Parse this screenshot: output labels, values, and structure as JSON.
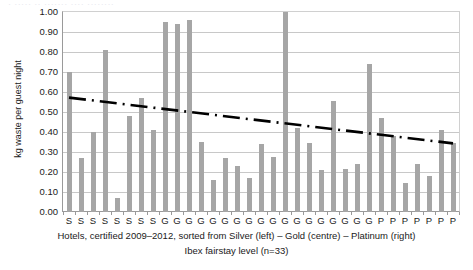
{
  "title_remnant": "· ····· ·· ······· ···· ········",
  "chart_data": {
    "type": "bar",
    "title": "",
    "xlabel": "Hotels, certified 2009–2012, sorted from Silver (left) – Gold (centre) – Platinum (right)",
    "xlabel_line2": "Ibex fairstay level (n=33)",
    "ylabel": "kg waste per guest night",
    "ylim": [
      0.0,
      1.0
    ],
    "ytick_labels": [
      "1.00",
      "0.90",
      "0.80",
      "0.70",
      "0.60",
      "0.50",
      "0.40",
      "0.30",
      "0.20",
      "0.10",
      "0.00"
    ],
    "ytick_values": [
      1.0,
      0.9,
      0.8,
      0.7,
      0.6,
      0.5,
      0.4,
      0.3,
      0.2,
      0.1,
      0.0
    ],
    "grid": true,
    "legend": "none",
    "bar_color": "#a6a6a6",
    "trend_color": "#000000",
    "n": 33,
    "categories": [
      "S",
      "S",
      "S",
      "S",
      "S",
      "S",
      "S",
      "S",
      "G",
      "G",
      "G",
      "G",
      "G",
      "G",
      "G",
      "G",
      "G",
      "G",
      "G",
      "G",
      "G",
      "G",
      "G",
      "G",
      "G",
      "G",
      "P",
      "P",
      "P",
      "P",
      "P",
      "P",
      "P"
    ],
    "values": [
      0.7,
      0.27,
      0.4,
      0.81,
      0.07,
      0.48,
      0.57,
      0.41,
      0.95,
      0.94,
      0.96,
      0.35,
      0.16,
      0.27,
      0.23,
      0.17,
      0.34,
      0.275,
      1.0,
      0.42,
      0.345,
      0.21,
      0.555,
      0.215,
      0.24,
      0.74,
      0.47,
      0.38,
      0.145,
      0.24,
      0.18,
      0.41,
      0.345
    ],
    "series": [
      {
        "name": "kg waste per guest night",
        "values": [
          0.7,
          0.27,
          0.4,
          0.81,
          0.07,
          0.48,
          0.57,
          0.41,
          0.95,
          0.94,
          0.96,
          0.35,
          0.16,
          0.27,
          0.23,
          0.17,
          0.34,
          0.275,
          1.0,
          0.42,
          0.345,
          0.21,
          0.555,
          0.215,
          0.24,
          0.74,
          0.47,
          0.38,
          0.145,
          0.24,
          0.18,
          0.41,
          0.345
        ]
      }
    ],
    "trendline": {
      "style": "dash-dot",
      "start_value": 0.572,
      "end_value": 0.343
    },
    "category_groups": [
      {
        "code": "S",
        "label": "Silver",
        "count": 8
      },
      {
        "code": "G",
        "label": "Gold",
        "count": 18
      },
      {
        "code": "P",
        "label": "Platinum",
        "count": 7
      }
    ]
  }
}
